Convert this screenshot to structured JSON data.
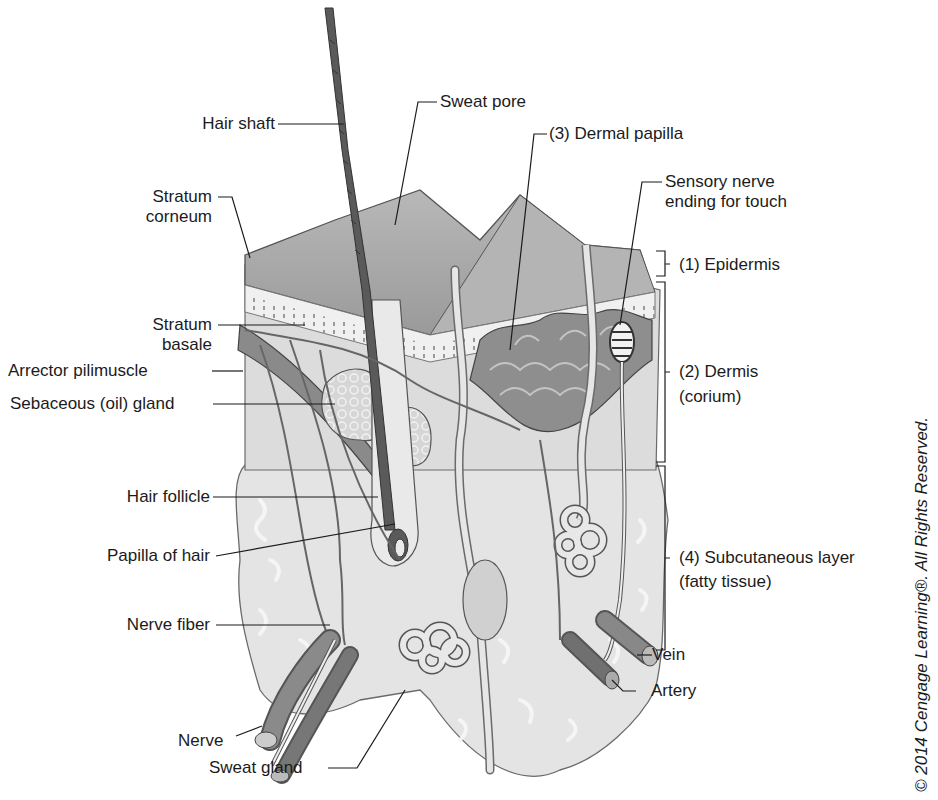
{
  "figure": {
    "copyright": "© 2014 Cengage Learning®. All Rights Reserved."
  },
  "labels_left": [
    {
      "id": "hair-shaft",
      "text": "Hair shaft"
    },
    {
      "id": "stratum-corneum",
      "line1": "Stratum",
      "line2": "corneum"
    },
    {
      "id": "stratum-basale",
      "line1": "Stratum",
      "line2": "basale"
    },
    {
      "id": "arrector-pili",
      "text": "Arrector pilimuscle"
    },
    {
      "id": "sebaceous-gland",
      "text": "Sebaceous (oil) gland"
    },
    {
      "id": "hair-follicle",
      "text": "Hair follicle"
    },
    {
      "id": "papilla-of-hair",
      "text": "Papilla of hair"
    },
    {
      "id": "nerve-fiber",
      "text": "Nerve fiber"
    },
    {
      "id": "nerve",
      "text": "Nerve"
    },
    {
      "id": "sweat-gland",
      "text": "Sweat gland"
    }
  ],
  "labels_top": [
    {
      "id": "sweat-pore",
      "text": "Sweat pore"
    },
    {
      "id": "dermal-papilla",
      "text": "(3) Dermal papilla"
    },
    {
      "id": "sensory-nerve",
      "line1": "Sensory nerve",
      "line2": "ending for touch"
    }
  ],
  "labels_right": [
    {
      "id": "epidermis",
      "text": "(1) Epidermis"
    },
    {
      "id": "dermis",
      "line1": "(2) Dermis",
      "line2": "(corium)"
    },
    {
      "id": "subcutaneous",
      "line1": "(4) Subcutaneous layer",
      "line2": "(fatty tissue)"
    },
    {
      "id": "vein",
      "text": "Vein"
    },
    {
      "id": "artery",
      "text": "Artery"
    }
  ],
  "colors": {
    "ink": "#1b1b1b",
    "epidermis_top": "#a9a9a9",
    "hair": "#5a5a5a",
    "dermis": "#dcdcdc",
    "papilla": "#8e8e8e",
    "fat": "#e6e6e6",
    "vessel": "#7a7a7a"
  }
}
